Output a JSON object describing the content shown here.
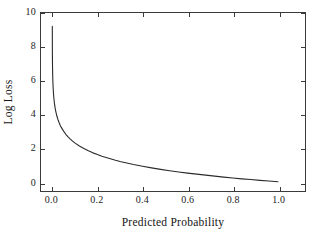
{
  "chart_data": {
    "type": "line",
    "title": "",
    "xlabel": "Predicted Probability",
    "ylabel": "Log Loss",
    "xlim": [
      -0.05,
      1.12
    ],
    "ylim": [
      -0.55,
      10.0
    ],
    "grid": false,
    "legend": null,
    "xticks": [
      "0.0",
      "0.2",
      "0.4",
      "0.6",
      "0.8",
      "1.0"
    ],
    "xtickvalues": [
      0.0,
      0.2,
      0.4,
      0.6,
      0.8,
      1.0
    ],
    "yticks": [
      "0",
      "2",
      "4",
      "6",
      "8",
      "10"
    ],
    "ytickvalues": [
      0,
      2,
      4,
      6,
      8,
      10
    ],
    "line_color": "#2b2b2b",
    "line_width": 1.1,
    "series": [
      {
        "name": "Log Loss = -log(p)",
        "x": [
          0.0001,
          0.0005,
          0.001,
          0.002,
          0.003,
          0.004,
          0.005,
          0.0065,
          0.008,
          0.01,
          0.0125,
          0.015,
          0.0175,
          0.02,
          0.025,
          0.03,
          0.035,
          0.04,
          0.05,
          0.06,
          0.07,
          0.08,
          0.09,
          0.1,
          0.12,
          0.14,
          0.16,
          0.18,
          0.2,
          0.22,
          0.25,
          0.28,
          0.3,
          0.33,
          0.36,
          0.4,
          0.44,
          0.48,
          0.52,
          0.56,
          0.6,
          0.64,
          0.68,
          0.72,
          0.76,
          0.8,
          0.84,
          0.88,
          0.92,
          0.96,
          1.0
        ],
        "y": [
          9.21,
          7.6,
          6.91,
          6.21,
          5.81,
          5.52,
          5.3,
          5.04,
          4.83,
          4.61,
          4.38,
          4.2,
          4.05,
          3.91,
          3.69,
          3.51,
          3.35,
          3.22,
          3.0,
          2.81,
          2.66,
          2.53,
          2.41,
          2.3,
          2.12,
          1.97,
          1.83,
          1.71,
          1.61,
          1.51,
          1.39,
          1.27,
          1.2,
          1.11,
          1.02,
          0.92,
          0.82,
          0.73,
          0.65,
          0.58,
          0.51,
          0.45,
          0.39,
          0.33,
          0.27,
          0.22,
          0.17,
          0.13,
          0.08,
          0.04,
          0.0
        ]
      }
    ]
  },
  "axes": {
    "frame_color": "#3a3a3a",
    "background": "#ffffff"
  }
}
